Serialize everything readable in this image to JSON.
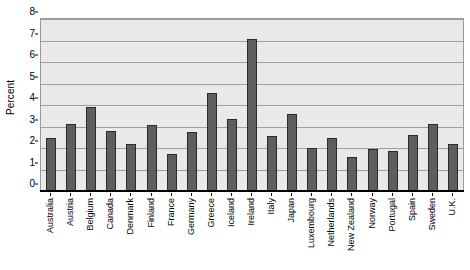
{
  "chart_data": {
    "type": "bar",
    "title": "",
    "xlabel": "",
    "ylabel": "Percent",
    "ylim": [
      0,
      8
    ],
    "yticks": [
      0,
      1,
      2,
      3,
      4,
      5,
      6,
      7,
      8
    ],
    "grid": true,
    "legend": false,
    "categories": [
      "Australia",
      "Austria",
      "Belgium",
      "Canada",
      "Denmark",
      "Finland",
      "France",
      "Germany",
      "Greece",
      "Iceland",
      "Ireland",
      "Italy",
      "Japan",
      "Luxembourg",
      "Netherlands",
      "New Zealand",
      "Norway",
      "Portugal",
      "Spain",
      "Sweden",
      "U.K."
    ],
    "values": [
      2.45,
      3.1,
      3.9,
      2.8,
      2.2,
      3.05,
      1.7,
      2.75,
      4.55,
      3.35,
      7.05,
      2.55,
      3.6,
      2.0,
      2.45,
      1.6,
      1.95,
      1.85,
      2.6,
      3.1,
      2.2
    ],
    "colors": {
      "bar_fill": "#5e5e5e",
      "bar_edge": "#2b2b2b",
      "plot_background": "#e9e9e9",
      "gridline": "#9d9d9d",
      "axis": "#000000",
      "figure_background": "#ffffff"
    }
  }
}
